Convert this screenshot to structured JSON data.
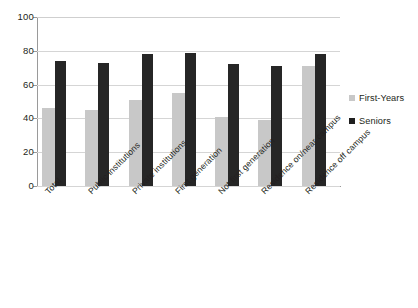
{
  "chart_data": {
    "type": "bar",
    "title": "",
    "subtitle": "",
    "xlabel": "",
    "ylabel": "",
    "ylim": [
      0,
      100
    ],
    "yticks": [
      0,
      20,
      40,
      60,
      80,
      100
    ],
    "ytick_labels": [
      "0",
      "20",
      "40",
      "60",
      "80",
      "100"
    ],
    "grid": true,
    "legend_position": "right",
    "categories": [
      "Total",
      "Public institutions",
      "Private institutions",
      "First generation",
      "Not first generation",
      "Residence on/near campus",
      "Residence off campus"
    ],
    "series": [
      {
        "name": "First-Years",
        "color": "#c8c8c8",
        "values": [
          46,
          45,
          51,
          55,
          41,
          39,
          71
        ]
      },
      {
        "name": "Seniors",
        "color": "#262626",
        "values": [
          74,
          73,
          78,
          79,
          72,
          71,
          78
        ]
      }
    ]
  },
  "legend": {
    "items": [
      {
        "label": "First-Years",
        "swatch": "legend-swatch-first-years"
      },
      {
        "label": "Seniors",
        "swatch": "legend-swatch-seniors"
      }
    ]
  }
}
